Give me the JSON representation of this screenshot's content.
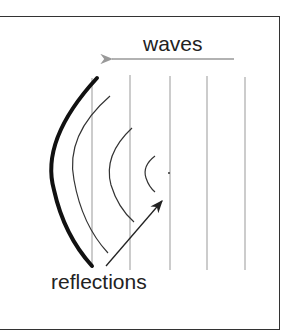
{
  "diagram": {
    "labels": {
      "waves": "waves",
      "reflections": "reflections"
    },
    "colors": {
      "frame": "#333333",
      "wavefront": "#999999",
      "reflector": "#111111",
      "reflection": "#333333",
      "arrow_waves": "#999999",
      "arrow_reflections": "#222222"
    },
    "wavefront_lines_x": [
      92,
      130,
      170,
      207,
      245
    ],
    "reflection_arcs": 4
  }
}
